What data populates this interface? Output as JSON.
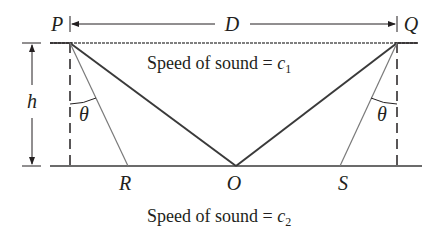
{
  "figure": {
    "points": {
      "P": "P",
      "Q": "Q",
      "R": "R",
      "O": "O",
      "S": "S"
    },
    "dimensions": {
      "horizontal": "D",
      "vertical": "h"
    },
    "angles": {
      "left": "θ",
      "right": "θ"
    },
    "media": {
      "upper": {
        "prefix": "Speed of sound = ",
        "symbol": "c",
        "subscript": "1"
      },
      "lower": {
        "prefix": "Speed of sound = ",
        "symbol": "c",
        "subscript": "2"
      }
    },
    "colors": {
      "dark_line": "#3a3a3a",
      "light_line": "#7a7a7a",
      "text": "#231f20"
    }
  }
}
